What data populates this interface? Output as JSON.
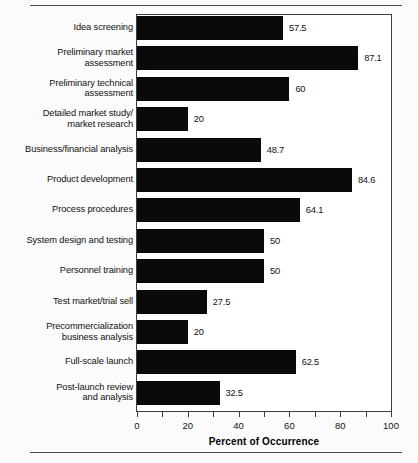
{
  "chart_data": {
    "type": "bar",
    "orientation": "horizontal",
    "title": "",
    "xlabel": "Percent of Occurrence",
    "ylabel": "",
    "xlim": [
      0,
      100
    ],
    "xticks": [
      0,
      10,
      20,
      30,
      40,
      50,
      60,
      70,
      80,
      90,
      100
    ],
    "xtick_labels": [
      "0",
      "",
      "20",
      "",
      "40",
      "",
      "60",
      "",
      "80",
      "",
      "100"
    ],
    "grid": false,
    "legend": null,
    "bar_color": "#0a0a0a",
    "categories": [
      "Idea screening",
      "Preliminary market\nassessment",
      "Preliminary technical\nassessment",
      "Detailed market study/\nmarket research",
      "Business/financial analysis",
      "Product development",
      "Process procedures",
      "System design and testing",
      "Personnel training",
      "Test market/trial sell",
      "Precommercialization\nbusiness analysis",
      "Full-scale launch",
      "Post-launch review\nand analysis"
    ],
    "values": [
      57.5,
      87.1,
      60,
      20,
      48.7,
      84.6,
      64.1,
      50,
      50,
      27.5,
      20,
      62.5,
      32.5
    ],
    "value_labels": [
      "57.5",
      "87.1",
      "60",
      "20",
      "48.7",
      "84.6",
      "64.1",
      "50",
      "50",
      "27.5",
      "20",
      "62.5",
      "32.5"
    ]
  }
}
